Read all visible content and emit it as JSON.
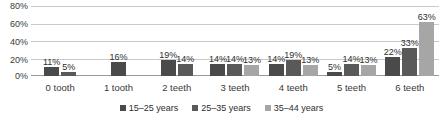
{
  "chart_data": {
    "type": "bar",
    "title": "",
    "subtitle": "",
    "xlabel": "",
    "ylabel": "",
    "ylim": [
      0,
      80
    ],
    "y_ticks": [
      "0%",
      "20%",
      "40%",
      "60%",
      "80%"
    ],
    "y_tick_values": [
      0,
      20,
      40,
      60,
      80
    ],
    "grid": true,
    "legend_position": "bottom",
    "orientation": "vertical",
    "value_suffix": "%",
    "categories": [
      "0 tooth",
      "1 tooth",
      "2 teeth",
      "3 teeth",
      "4 teeth",
      "5 teeth",
      "6 teeth"
    ],
    "series": [
      {
        "name": "15–25 years",
        "color": "#4a4a4a",
        "values": [
          11,
          16,
          19,
          14,
          14,
          5,
          22
        ],
        "labels": [
          "11%",
          "16%",
          "19%",
          "14%",
          "14%",
          "5%",
          "22%"
        ]
      },
      {
        "name": "25–35 years",
        "color": "#595959",
        "values": [
          5,
          null,
          14,
          14,
          19,
          14,
          33
        ],
        "labels": [
          "5%",
          "",
          "14%",
          "14%",
          "19%",
          "14%",
          "33%"
        ]
      },
      {
        "name": "35–44 years",
        "color": "#a6a6a6",
        "values": [
          null,
          null,
          null,
          13,
          13,
          13,
          63
        ],
        "labels": [
          "",
          "",
          "",
          "13%",
          "13%",
          "13%",
          "63%"
        ]
      }
    ]
  },
  "colors": {
    "series_1": "#4a4a4a",
    "series_2": "#595959",
    "series_3": "#a6a6a6",
    "gridline": "#c9c9c9",
    "axis": "#9a9a9a",
    "text": "#2e2e2e",
    "background": "#ffffff"
  }
}
